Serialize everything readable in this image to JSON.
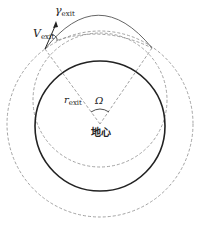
{
  "diagram": {
    "labels": {
      "gamma": "γ",
      "gamma_sub": "exit",
      "velocity": "V",
      "velocity_sub": "exit",
      "radius": "r",
      "radius_sub": "exit",
      "omega": "Ω",
      "center": "地心"
    },
    "colors": {
      "earth": "#222222",
      "dashed": "#888888",
      "trajectory": "#555555"
    }
  }
}
